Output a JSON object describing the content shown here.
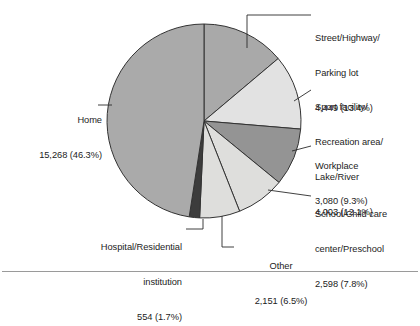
{
  "figure": {
    "background_color": "#ffffff",
    "rule_color": "#9a9a9a"
  },
  "chart_data": {
    "type": "pie",
    "title": "",
    "subtitle": "",
    "xlabel": "",
    "ylabel": "",
    "legend_position": "callout-labels",
    "grid": false,
    "total": 33103,
    "start_angle_deg": 0,
    "direction": "clockwise",
    "categories": [
      "Street/Highway/Parking lot",
      "Sport facility/Recreation area/Lake/River",
      "Workplace",
      "School/Child care center/Preschool",
      "Other",
      "Hospital/Residential institution",
      "Home"
    ],
    "values": [
      4449,
      4003,
      3080,
      2598,
      2151,
      554,
      15268
    ],
    "percents": [
      13.4,
      12.1,
      9.3,
      7.8,
      6.5,
      1.7,
      46.3
    ],
    "value_labels": [
      "4,449",
      "4,003",
      "3,080",
      "2,598",
      "2,151",
      "554",
      "15,268"
    ],
    "percent_labels": [
      "(13.4%)",
      "(12.1%)",
      "(9.3%)",
      "(7.8%)",
      "(6.5%)",
      "(1.7%)",
      "(46.3%)"
    ],
    "slice_colors": [
      "#a9a9a9",
      "#e2e2e2",
      "#949494",
      "#dededc",
      "#dededc",
      "#3c3c3c",
      "#aaaaaa"
    ],
    "slice_edge_color": "#333333"
  },
  "labels": {
    "street": {
      "line1": "Street/Highway/",
      "line2": "Parking lot",
      "line3": "4,449 (13.4%)"
    },
    "sport": {
      "line1": "Sport facility/",
      "line2": "Recreation area/",
      "line3": "Lake/River",
      "line4": "4,003 (12.1%)"
    },
    "workplace": {
      "line1": "Workplace",
      "line2": "3,080 (9.3%)"
    },
    "school": {
      "line1": "School/Child care",
      "line2": "center/Preschool",
      "line3": "2,598 (7.8%)"
    },
    "other": {
      "line1": "Other",
      "line2": "2,151 (6.5%)"
    },
    "hospital": {
      "line1": "Hospital/Residential",
      "line2": "institution",
      "line3": "554 (1.7%)"
    },
    "home": {
      "line1": "Home",
      "line2": "15,268 (46.3%)"
    }
  }
}
